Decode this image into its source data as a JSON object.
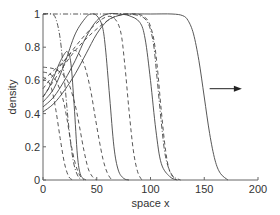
{
  "chart_data": {
    "type": "line",
    "title": "",
    "xlabel": "space x",
    "ylabel": "density",
    "xlim": [
      0,
      200
    ],
    "ylim": [
      0,
      1
    ],
    "xticks": [
      0,
      50,
      100,
      150,
      200
    ],
    "yticks": [
      0,
      0.2,
      0.4,
      0.6,
      0.8,
      1
    ],
    "xtick_labels": [
      "0",
      "50",
      "100",
      "150",
      "200"
    ],
    "ytick_labels": [
      "0",
      "0.2",
      "0.4",
      "0.6",
      "0.8",
      "1"
    ],
    "grid": false,
    "legend": "none",
    "annotation": {
      "type": "arrow",
      "direction": "right",
      "x_from": 155,
      "x_to": 185,
      "y": 0.55,
      "meaning": "direction of wave propagation"
    },
    "series": [
      {
        "name": "solid-1",
        "style": "solid",
        "x": [
          0,
          5,
          10,
          15,
          20,
          23,
          26,
          29,
          32,
          35,
          40
        ],
        "y": [
          0.5,
          0.55,
          0.62,
          0.7,
          0.76,
          0.77,
          0.7,
          0.45,
          0.15,
          0.03,
          0.0
        ]
      },
      {
        "name": "solid-2",
        "style": "solid",
        "x": [
          0,
          10,
          20,
          30,
          40,
          45,
          50,
          55,
          58,
          62,
          66,
          70,
          75,
          80
        ],
        "y": [
          0.47,
          0.55,
          0.7,
          0.88,
          0.98,
          1.0,
          0.99,
          0.93,
          0.8,
          0.5,
          0.2,
          0.06,
          0.01,
          0.0
        ]
      },
      {
        "name": "solid-3",
        "style": "solid",
        "x": [
          0,
          10,
          20,
          30,
          40,
          50,
          60,
          70,
          80,
          90,
          95,
          100,
          105,
          110,
          118,
          125
        ],
        "y": [
          0.44,
          0.5,
          0.6,
          0.72,
          0.86,
          0.96,
          1.0,
          1.0,
          0.99,
          0.95,
          0.85,
          0.6,
          0.3,
          0.1,
          0.02,
          0.0
        ]
      },
      {
        "name": "solid-4",
        "style": "solid",
        "x": [
          0,
          10,
          20,
          30,
          40,
          50,
          60,
          70,
          80,
          100,
          120,
          130,
          135,
          140,
          145,
          150,
          155,
          160,
          165,
          172
        ],
        "y": [
          0.41,
          0.46,
          0.54,
          0.64,
          0.76,
          0.88,
          0.96,
          0.99,
          1.0,
          1.0,
          1.0,
          0.99,
          0.96,
          0.88,
          0.72,
          0.5,
          0.28,
          0.12,
          0.04,
          0.0
        ]
      },
      {
        "name": "dashed-1",
        "style": "dashed",
        "x": [
          0,
          4,
          8,
          12,
          16,
          20,
          24,
          28
        ],
        "y": [
          0.62,
          0.6,
          0.55,
          0.42,
          0.25,
          0.1,
          0.02,
          0.0
        ]
      },
      {
        "name": "dashed-2",
        "style": "dashed",
        "x": [
          0,
          6,
          12,
          18,
          22,
          26,
          30,
          34,
          38
        ],
        "y": [
          0.65,
          0.64,
          0.6,
          0.5,
          0.38,
          0.22,
          0.1,
          0.03,
          0.0
        ]
      },
      {
        "name": "dashed-3",
        "style": "dashed",
        "x": [
          0,
          10,
          18,
          24,
          30,
          34,
          38,
          42,
          46,
          50
        ],
        "y": [
          0.68,
          0.67,
          0.64,
          0.58,
          0.45,
          0.32,
          0.18,
          0.07,
          0.02,
          0.0
        ]
      },
      {
        "name": "dashed-4",
        "style": "dashed",
        "x": [
          0,
          10,
          20,
          30,
          38,
          44,
          48,
          52,
          56,
          60,
          64
        ],
        "y": [
          0.6,
          0.66,
          0.72,
          0.78,
          0.7,
          0.55,
          0.4,
          0.25,
          0.12,
          0.04,
          0.0
        ]
      },
      {
        "name": "dashed-5",
        "style": "dashed",
        "x": [
          0,
          20,
          40,
          55,
          65,
          72,
          76,
          80,
          84,
          88,
          92
        ],
        "y": [
          0.55,
          0.72,
          0.88,
          0.97,
          0.98,
          0.9,
          0.7,
          0.42,
          0.18,
          0.05,
          0.0
        ]
      },
      {
        "name": "dashed-6",
        "style": "dashed",
        "x": [
          0,
          30,
          60,
          80,
          95,
          102,
          106,
          110,
          114,
          118,
          124
        ],
        "y": [
          0.5,
          0.78,
          0.96,
          1.0,
          0.98,
          0.88,
          0.7,
          0.42,
          0.18,
          0.05,
          0.0
        ]
      },
      {
        "name": "dashdot-1",
        "style": "dashdot",
        "x": [
          0,
          8,
          12,
          16,
          20,
          24,
          28,
          32,
          36
        ],
        "y": [
          1.0,
          1.0,
          0.97,
          0.85,
          0.6,
          0.32,
          0.12,
          0.03,
          0.0
        ]
      },
      {
        "name": "dashdot-2",
        "style": "dashdot",
        "x": [
          0,
          40,
          60,
          80,
          95,
          102,
          106,
          110,
          114,
          120,
          128
        ],
        "y": [
          1.0,
          1.0,
          1.0,
          1.0,
          0.97,
          0.85,
          0.62,
          0.35,
          0.14,
          0.03,
          0.0
        ]
      }
    ]
  }
}
